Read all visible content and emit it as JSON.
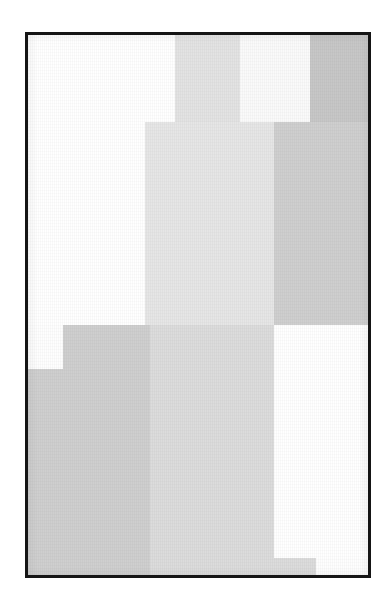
{
  "artwork": {
    "title": "Untitled Geometric Composition",
    "medium_appearance": "grayscale rectangular blocks on white ground",
    "page_background": "#ffffff"
  },
  "frame": {
    "name": "black-rectangular-frame",
    "border_color": "#151515",
    "border_width_px": 3,
    "left": 25,
    "top": 32,
    "width": 346,
    "height": 546,
    "fill": "#ffffff"
  },
  "canvas": {
    "background": "#fefefe",
    "width": 340,
    "height": 540
  },
  "palette": {
    "white": "#ffffff",
    "near_white": "#fbfbfb",
    "lightest_gray": "#f4f4f4",
    "light_gray": "#e8e8e8",
    "mid_light_gray": "#dedede",
    "mid_gray": "#d2d2d2",
    "dark_gray": "#c6c6c6",
    "frame_black": "#151515"
  },
  "blocks": [
    {
      "id": "block-top-left-white",
      "label": "Top left white field",
      "tone": "white",
      "color": "#ffffff",
      "x": 0,
      "y": 0,
      "w": 147,
      "h": 290
    },
    {
      "id": "block-top-column-a",
      "label": "Upper narrow light gray column",
      "tone": "light_gray",
      "color": "#e3e3e3",
      "x": 147,
      "y": 0,
      "w": 65,
      "h": 87
    },
    {
      "id": "block-top-highlight-band",
      "label": "Upper near-white highlight band",
      "tone": "near_white",
      "color": "#fafafa",
      "x": 212,
      "y": 0,
      "w": 70,
      "h": 87
    },
    {
      "id": "block-top-right-dark",
      "label": "Upper right dark gray column",
      "tone": "dark_gray",
      "color": "#c7c7c7",
      "x": 282,
      "y": 0,
      "w": 58,
      "h": 87
    },
    {
      "id": "block-center-light-column",
      "label": "Central tall light gray column",
      "tone": "light_gray",
      "color": "#e6e6e6",
      "x": 117,
      "y": 87,
      "w": 129,
      "h": 203
    },
    {
      "id": "block-mid-right-gray",
      "label": "Middle right medium gray block",
      "tone": "mid_gray",
      "color": "#cfcfcf",
      "x": 246,
      "y": 87,
      "w": 94,
      "h": 203
    },
    {
      "id": "block-lower-left-upper-step",
      "label": "Lower left gray upper step",
      "tone": "mid_gray",
      "color": "#cfcfcf",
      "x": 35,
      "y": 290,
      "w": 87,
      "h": 44
    },
    {
      "id": "block-lower-left-main",
      "label": "Lower left gray main mass",
      "tone": "mid_gray",
      "color": "#cfcfcf",
      "x": 0,
      "y": 334,
      "w": 122,
      "h": 206
    },
    {
      "id": "block-lower-center-light",
      "label": "Lower center light gray column",
      "tone": "mid_light_gray",
      "color": "#dcdcdc",
      "x": 122,
      "y": 290,
      "w": 124,
      "h": 250
    },
    {
      "id": "block-bottom-notch",
      "label": "Bottom right small gray notch",
      "tone": "mid_light_gray",
      "color": "#dcdcdc",
      "x": 246,
      "y": 523,
      "w": 42,
      "h": 17
    },
    {
      "id": "block-lower-right-white",
      "label": "Lower right white field",
      "tone": "white",
      "color": "#ffffff",
      "x": 246,
      "y": 290,
      "w": 94,
      "h": 233
    }
  ],
  "overlays": {
    "texture_name": "woven-paper-texture",
    "vignette_name": "scan-edge-vignette"
  }
}
